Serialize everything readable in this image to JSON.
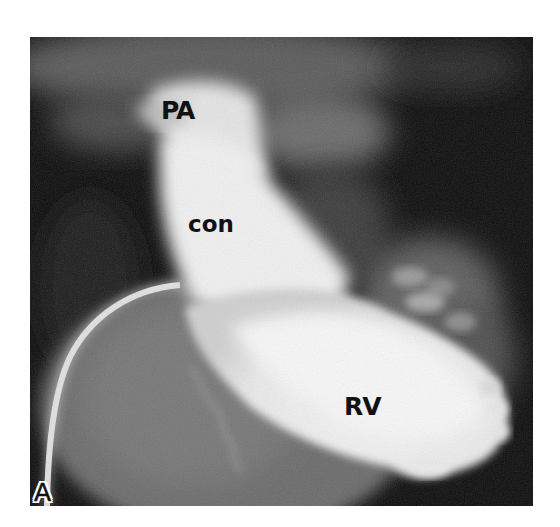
{
  "figure": {
    "type": "right ventricular angiogram",
    "panel_letter": "A",
    "labels": {
      "pa": "PA",
      "con": "con",
      "rv": "RV"
    },
    "colors": {
      "background": "#ffffff",
      "film_dark": "#0b0b0b",
      "contrast_bright": "#f2f2f2",
      "soft_tissue": "#6e6e6e",
      "label_text": "#111111"
    }
  }
}
